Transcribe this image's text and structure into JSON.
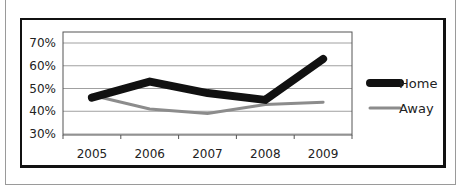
{
  "chart_data": {
    "type": "line",
    "title": "",
    "xlabel": "",
    "ylabel": "",
    "categories": [
      "2005",
      "2006",
      "2007",
      "2008",
      "2009"
    ],
    "series": [
      {
        "name": "Home",
        "values": [
          0.46,
          0.53,
          0.48,
          0.45,
          0.63
        ],
        "color": "#111111",
        "stroke_width": 8
      },
      {
        "name": "Away",
        "values": [
          0.47,
          0.41,
          0.39,
          0.43,
          0.44
        ],
        "color": "#8c8c8c",
        "stroke_width": 3
      }
    ],
    "y_ticks": [
      "30%",
      "40%",
      "50%",
      "60%",
      "70%"
    ],
    "ylim": [
      0.3,
      0.75
    ],
    "grid": true,
    "legend_position": "right"
  },
  "legend": {
    "items": [
      {
        "label": "Home",
        "color": "#111111"
      },
      {
        "label": "Away",
        "color": "#8c8c8c"
      }
    ]
  }
}
